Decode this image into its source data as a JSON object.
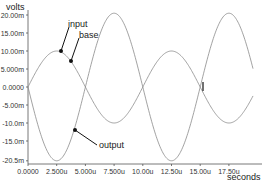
{
  "chart_data": {
    "type": "line",
    "title": "",
    "ylabel": "volts",
    "xlabel": "seconds",
    "xlim": [
      0,
      19.6
    ],
    "ylim": [
      -20.5,
      20.0
    ],
    "grid": false,
    "legend": "annotations",
    "x_ticks": [
      {
        "value": 0,
        "label": "0.0000"
      },
      {
        "value": 2.5,
        "label": "2.500u"
      },
      {
        "value": 5.0,
        "label": "5.000u"
      },
      {
        "value": 7.5,
        "label": "7.500u"
      },
      {
        "value": 10.0,
        "label": "10.00u"
      },
      {
        "value": 12.5,
        "label": "12.50u"
      },
      {
        "value": 15.0,
        "label": "15.00u"
      },
      {
        "value": 17.5,
        "label": "17.50u"
      }
    ],
    "y_ticks": [
      {
        "value": 20,
        "label": "20.00m"
      },
      {
        "value": 15,
        "label": "15.00m"
      },
      {
        "value": 10,
        "label": "10.00m"
      },
      {
        "value": 5,
        "label": "5.000m"
      },
      {
        "value": 0,
        "label": "0.0000"
      },
      {
        "value": -5,
        "label": "-5.00m"
      },
      {
        "value": -10,
        "label": "-10.0m"
      },
      {
        "value": -15,
        "label": "-15.0m"
      },
      {
        "value": -20.5,
        "label": "-20.5m"
      }
    ],
    "series": [
      {
        "name": "input",
        "amplitude": 10.0,
        "period": 10.0,
        "phase": 0,
        "x": [
          0,
          2.5,
          5,
          7.5,
          10,
          12.5,
          15,
          17.5
        ],
        "values": [
          0,
          10,
          0,
          -10,
          0,
          10,
          0,
          -10
        ]
      },
      {
        "name": "base",
        "amplitude": 10.0,
        "period": 10.0,
        "phase": 0,
        "x": [
          0,
          2.5,
          5,
          7.5,
          10,
          12.5,
          15,
          17.5
        ],
        "values": [
          0,
          10,
          0,
          -10,
          0,
          10,
          0,
          -10
        ]
      },
      {
        "name": "output",
        "amplitude": -20.5,
        "period": 10.0,
        "phase": 0,
        "x": [
          0,
          2.5,
          5,
          7.5,
          10,
          12.5,
          15,
          17.5
        ],
        "values": [
          0,
          -20.5,
          0,
          20.5,
          0,
          -20.5,
          0,
          20.5
        ]
      }
    ],
    "annotations": [
      {
        "text": "input",
        "points_to": "input"
      },
      {
        "text": "base",
        "points_to": "base"
      },
      {
        "text": "output",
        "points_to": "output"
      }
    ]
  },
  "labels": {
    "ylabel": "volts",
    "xlabel": "seconds",
    "input": "input",
    "base": "base",
    "output": "output"
  },
  "colors": {
    "curve": "#8a8a8a",
    "axis": "#555555",
    "marker": "#111111"
  }
}
